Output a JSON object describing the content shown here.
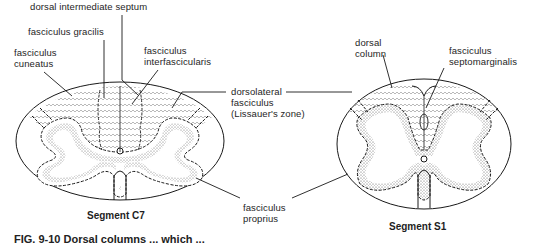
{
  "figure": {
    "type": "spinal cord cross-section diagram",
    "caption_partial": "FIG. 9-10  Dorsal columns ... which ..."
  },
  "labels": {
    "dorsal_intermediate_septum": "dorsal intermediate septum",
    "fasciculus_gracilis": "fasciculus gracilis",
    "fasciculus_cuneatus": [
      "fasciculus",
      "cuneatus"
    ],
    "fasciculus_interfascicularis": [
      "fasciculus",
      "interfascicularis"
    ],
    "dorsolateral_fasciculus": [
      "dorsolateral",
      "fasciculus",
      "(Lissauer's zone)"
    ],
    "dorsal_column": [
      "dorsal",
      "column"
    ],
    "fasciculus_septomarginalis": [
      "fasciculus",
      "septomarginalis"
    ],
    "fasciculus_proprius": [
      "fasciculus",
      "proprius"
    ]
  },
  "segments": {
    "left": "Segment C7",
    "right": "Segment S1"
  },
  "colors": {
    "ink": "#1a1a1a",
    "stipple": "#9a9a9a",
    "background": "#ffffff"
  }
}
